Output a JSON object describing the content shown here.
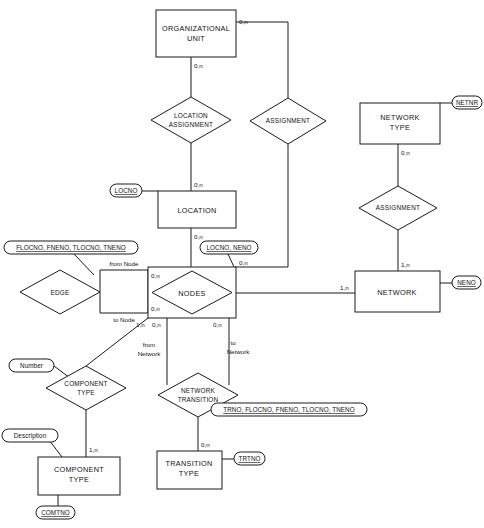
{
  "diagram": {
    "type": "er-diagram",
    "entities": [
      {
        "id": "organizational-unit",
        "label_line1": "ORGANIZATIONAL",
        "label_line2": "UNIT"
      },
      {
        "id": "location",
        "label_line1": "LOCATION",
        "label_line2": ""
      },
      {
        "id": "network-type",
        "label_line1": "NETWORK",
        "label_line2": "TYPE"
      },
      {
        "id": "network",
        "label_line1": "NETWORK",
        "label_line2": ""
      },
      {
        "id": "nodes",
        "label_line1": "NODES",
        "label_line2": ""
      },
      {
        "id": "component-type-entity",
        "label_line1": "COMPONENT",
        "label_line2": "TYPE"
      },
      {
        "id": "transition-type",
        "label_line1": "TRANSITION",
        "label_line2": "TYPE"
      }
    ],
    "relationships": [
      {
        "id": "location-assignment",
        "label_line1": "LOCATION",
        "label_line2": "ASSIGNMENT"
      },
      {
        "id": "assignment-org-nodes",
        "label_line1": "ASSIGNMENT",
        "label_line2": ""
      },
      {
        "id": "assignment-network",
        "label_line1": "ASSIGNMENT",
        "label_line2": ""
      },
      {
        "id": "edge",
        "label_line1": "EDGE",
        "label_line2": ""
      },
      {
        "id": "component-type-rel",
        "label_line1": "COMPONENT",
        "label_line2": "TYPE"
      },
      {
        "id": "network-transition",
        "label_line1": "NETWORK",
        "label_line2": "TRANSITION"
      }
    ],
    "attributes": [
      {
        "id": "attr-netnr",
        "text": "NETNR",
        "key": true
      },
      {
        "id": "attr-neno",
        "text": "NENO",
        "key": true
      },
      {
        "id": "attr-locno",
        "text": "LOCNO",
        "key": true
      },
      {
        "id": "attr-locno-neno",
        "text": "LOCNO, NENO",
        "key": true
      },
      {
        "id": "attr-edge-key",
        "text": "FLOCNO, FNENO, TLOCNO, TNENO",
        "key": true
      },
      {
        "id": "attr-number",
        "text": "Number",
        "key": false
      },
      {
        "id": "attr-description",
        "text": "Description",
        "key": false
      },
      {
        "id": "attr-transition-key",
        "text": "TRNO, FLOCNO, FNENO, TLOCNO, TNENO",
        "key": true
      },
      {
        "id": "attr-trtno",
        "text": "TRTNO",
        "key": true
      },
      {
        "id": "attr-comtno",
        "text": "COMTNO",
        "key": true
      }
    ],
    "cardinalities": [
      {
        "id": "card-org-right",
        "text": "0,n"
      },
      {
        "id": "card-org-bottom",
        "text": "0,n"
      },
      {
        "id": "card-location-top",
        "text": "0,n"
      },
      {
        "id": "card-location-bottom",
        "text": "0,n"
      },
      {
        "id": "card-nodes-top",
        "text": "0,n"
      },
      {
        "id": "card-nodes-right-assignment",
        "text": "0,n"
      },
      {
        "id": "card-edge-from",
        "text": "0,n"
      },
      {
        "id": "card-edge-to",
        "text": "0,n"
      },
      {
        "id": "card-nodes-bottom-comp",
        "text": "1,n"
      },
      {
        "id": "card-nodes-bottom-from",
        "text": "0,n"
      },
      {
        "id": "card-nodes-bottom-to",
        "text": "0,n"
      },
      {
        "id": "card-nettype-bottom",
        "text": "0,n"
      },
      {
        "id": "card-network-top",
        "text": "1,n"
      },
      {
        "id": "card-network-left",
        "text": "1,n"
      },
      {
        "id": "card-component-entity-top",
        "text": "1,n"
      },
      {
        "id": "card-transition-entity-top",
        "text": "0,n"
      }
    ],
    "roles": [
      {
        "id": "role-from-node",
        "text": "from Node"
      },
      {
        "id": "role-to-node",
        "text": "to Node"
      },
      {
        "id": "role-from-network-line1",
        "text": "from"
      },
      {
        "id": "role-from-network-line2",
        "text": "Network"
      },
      {
        "id": "role-to-network-line1",
        "text": "to"
      },
      {
        "id": "role-to-network-line2",
        "text": "Network"
      }
    ],
    "colors": {
      "stroke": "#1a1a1a",
      "fill": "#ffffff",
      "background": "#ffffff"
    }
  }
}
